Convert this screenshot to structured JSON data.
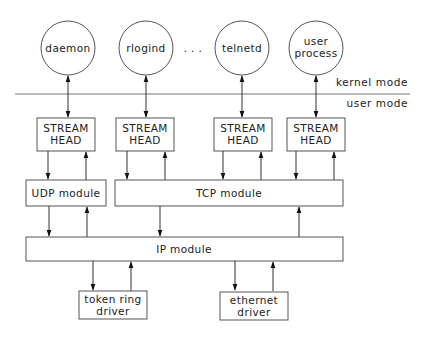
{
  "diagram": {
    "type": "STREAMS networking architecture",
    "modes": {
      "upper": "kernel mode",
      "lower": "user mode"
    },
    "processes": [
      {
        "id": "daemon",
        "label_lines": [
          "daemon"
        ]
      },
      {
        "id": "rlogind",
        "label_lines": [
          "rlogind"
        ]
      },
      {
        "id": "telnetd",
        "label_lines": [
          "telnetd"
        ]
      },
      {
        "id": "user_process",
        "label_lines": [
          "user",
          "process"
        ]
      }
    ],
    "ellipsis": ". . .",
    "stream_heads": [
      {
        "id": "sh_daemon",
        "label_lines": [
          "STREAM",
          "HEAD"
        ]
      },
      {
        "id": "sh_rlogind",
        "label_lines": [
          "STREAM",
          "HEAD"
        ]
      },
      {
        "id": "sh_telnetd",
        "label_lines": [
          "STREAM",
          "HEAD"
        ]
      },
      {
        "id": "sh_user",
        "label_lines": [
          "STREAM",
          "HEAD"
        ]
      }
    ],
    "modules": {
      "udp": "UDP module",
      "tcp": "TCP module",
      "ip": "IP module"
    },
    "drivers": [
      {
        "id": "token_ring",
        "label_lines": [
          "token ring",
          "driver"
        ]
      },
      {
        "id": "ethernet",
        "label_lines": [
          "ethernet",
          "driver"
        ]
      }
    ],
    "edges": [
      {
        "from": "daemon",
        "to": "sh_daemon",
        "dir": "both"
      },
      {
        "from": "rlogind",
        "to": "sh_rlogind",
        "dir": "both"
      },
      {
        "from": "telnetd",
        "to": "sh_telnetd",
        "dir": "both"
      },
      {
        "from": "user_process",
        "to": "sh_user",
        "dir": "both"
      },
      {
        "from": "sh_daemon",
        "to": "udp",
        "dir": "down"
      },
      {
        "from": "udp",
        "to": "sh_daemon",
        "dir": "up"
      },
      {
        "from": "sh_rlogind",
        "to": "tcp",
        "dir": "down"
      },
      {
        "from": "tcp",
        "to": "sh_rlogind",
        "dir": "up"
      },
      {
        "from": "sh_telnetd",
        "to": "tcp",
        "dir": "down"
      },
      {
        "from": "tcp",
        "to": "sh_telnetd",
        "dir": "up"
      },
      {
        "from": "sh_user",
        "to": "tcp",
        "dir": "down"
      },
      {
        "from": "tcp",
        "to": "sh_user",
        "dir": "up"
      },
      {
        "from": "udp",
        "to": "ip",
        "dir": "down"
      },
      {
        "from": "ip",
        "to": "udp",
        "dir": "up"
      },
      {
        "from": "tcp",
        "to": "ip",
        "dir": "down"
      },
      {
        "from": "ip",
        "to": "tcp",
        "dir": "up"
      },
      {
        "from": "ip",
        "to": "token_ring",
        "dir": "down"
      },
      {
        "from": "token_ring",
        "to": "ip",
        "dir": "up"
      },
      {
        "from": "ip",
        "to": "ethernet",
        "dir": "down"
      },
      {
        "from": "ethernet",
        "to": "ip",
        "dir": "up"
      }
    ]
  }
}
